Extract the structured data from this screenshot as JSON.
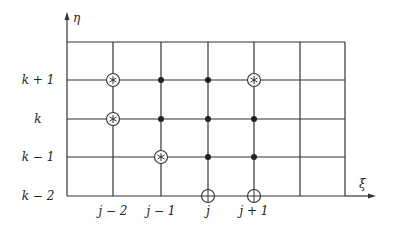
{
  "diagram": {
    "type": "computational-grid-stencil",
    "axes": {
      "horizontal": {
        "label": "ξ",
        "arrow": true
      },
      "vertical": {
        "label": "η",
        "arrow": true
      }
    },
    "grid": {
      "columns_x": [
        67,
        113,
        161,
        208,
        254,
        300,
        345
      ],
      "rows_y": [
        42,
        80,
        119,
        157,
        196
      ],
      "line_color": "#333333"
    },
    "row_labels": [
      {
        "text": "k + 1",
        "y": 80
      },
      {
        "text": "k",
        "y": 119
      },
      {
        "text": "k − 1",
        "y": 157
      },
      {
        "text": "k − 2",
        "y": 196
      }
    ],
    "column_labels": [
      {
        "text": "j − 2",
        "x": 113
      },
      {
        "text": "j − 1",
        "x": 161
      },
      {
        "text": "j",
        "x": 208
      },
      {
        "text": "j + 1",
        "x": 254
      }
    ],
    "points": {
      "circled_asterisk": [
        {
          "x": 113,
          "y": 80
        },
        {
          "x": 254,
          "y": 80
        },
        {
          "x": 113,
          "y": 119
        },
        {
          "x": 161,
          "y": 157
        }
      ],
      "filled_dot": [
        {
          "x": 161,
          "y": 80
        },
        {
          "x": 208,
          "y": 80
        },
        {
          "x": 161,
          "y": 119
        },
        {
          "x": 208,
          "y": 119
        },
        {
          "x": 254,
          "y": 119
        },
        {
          "x": 208,
          "y": 157
        },
        {
          "x": 254,
          "y": 157
        }
      ],
      "circled_plus": [
        {
          "x": 208,
          "y": 196
        },
        {
          "x": 254,
          "y": 196
        }
      ]
    }
  }
}
